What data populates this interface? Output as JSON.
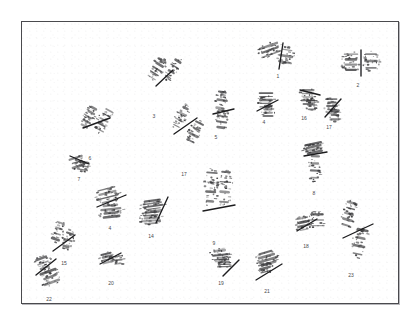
{
  "image": {
    "kind": "karyotype-chromosome-spread",
    "title": "",
    "background_color": "#ffffff",
    "frame_color": "#4a4a4e",
    "chromosome_ink_color": "#3a3a3c",
    "centromere_line_color": "#1c1c1e",
    "label_color": "#2e2e30",
    "width": 417,
    "height": 323
  },
  "plate": {
    "x": 21,
    "y": 21,
    "width": 378,
    "height": 283
  },
  "chart_data": {
    "type": "scatter",
    "title": "",
    "subtitle": "",
    "xlabel": "",
    "ylabel": "",
    "xlim": [
      0,
      417
    ],
    "ylim": [
      0,
      323
    ],
    "grid": false,
    "legend": "none",
    "annotations": [
      "Numbered human chromosome pairs arranged as a karyogram on a white plate with a thin dark frame"
    ],
    "categories": [
      "1",
      "2",
      "3",
      "4",
      "5",
      "6",
      "7",
      "8",
      "9",
      "11",
      "12",
      "14",
      "15",
      "16",
      "17",
      "18",
      "19",
      "20",
      "21",
      "22",
      "23"
    ],
    "values": [
      1,
      1,
      1,
      1,
      1,
      1,
      1,
      1,
      1,
      1,
      1,
      1,
      1,
      1,
      1,
      1,
      1,
      1,
      1,
      1,
      1
    ]
  },
  "chromosomes": [
    {
      "id": "chrom-1",
      "label": "1",
      "x": 253,
      "y": 35,
      "label_x": 277,
      "label_y": 73,
      "arms": [
        {
          "cx": 16,
          "cy": 14,
          "rx": 13,
          "ry": 7,
          "rot": -20,
          "blobs": 30
        },
        {
          "cx": 32,
          "cy": 20,
          "rx": 9,
          "ry": 10,
          "rot": 10,
          "blobs": 22
        }
      ],
      "bar": {
        "x1": 29,
        "y1": 7,
        "x2": 25,
        "y2": 33
      }
    },
    {
      "id": "chrom-2",
      "label": "2",
      "x": 338,
      "y": 46,
      "label_x": 357,
      "label_y": 82,
      "arms": [
        {
          "cx": 12,
          "cy": 15,
          "rx": 10,
          "ry": 11,
          "rot": 0,
          "blobs": 28
        },
        {
          "cx": 32,
          "cy": 14,
          "rx": 9,
          "ry": 11,
          "rot": 0,
          "blobs": 26
        }
      ],
      "bar": {
        "x1": 22,
        "y1": 3,
        "x2": 22,
        "y2": 29
      }
    },
    {
      "id": "chrom-3",
      "label": "3",
      "x": 142,
      "y": 52,
      "label_x": 153,
      "label_y": 113,
      "arms": [
        {
          "cx": 14,
          "cy": 16,
          "rx": 7,
          "ry": 13,
          "rot": 32,
          "blobs": 26
        },
        {
          "cx": 30,
          "cy": 16,
          "rx": 6,
          "ry": 13,
          "rot": 32,
          "blobs": 24
        }
      ],
      "bar": {
        "x1": 13,
        "y1": 33,
        "x2": 30,
        "y2": 17
      }
    },
    {
      "id": "chrom-6",
      "label": "6",
      "x": 75,
      "y": 100,
      "label_x": 89,
      "label_y": 155,
      "arms": [
        {
          "cx": 13,
          "cy": 16,
          "rx": 6,
          "ry": 13,
          "rot": 28,
          "blobs": 26
        },
        {
          "cx": 28,
          "cy": 19,
          "rx": 7,
          "ry": 14,
          "rot": 28,
          "blobs": 26
        }
      ],
      "bar": {
        "x1": 7,
        "y1": 27,
        "x2": 34,
        "y2": 17
      }
    },
    {
      "id": "chrom-17b",
      "label": "17",
      "x": 166,
      "y": 100,
      "label_x": 183,
      "label_y": 171,
      "arms": [
        {
          "cx": 14,
          "cy": 16,
          "rx": 6,
          "ry": 14,
          "rot": 27,
          "blobs": 26
        },
        {
          "cx": 28,
          "cy": 31,
          "rx": 7,
          "ry": 14,
          "rot": 27,
          "blobs": 26
        }
      ],
      "bar": {
        "x1": 7,
        "y1": 33,
        "x2": 30,
        "y2": 17
      }
    },
    {
      "id": "chrom-5",
      "label": "5",
      "x": 208,
      "y": 85,
      "label_x": 215,
      "label_y": 134,
      "arms": [
        {
          "cx": 12,
          "cy": 14,
          "rx": 6,
          "ry": 13,
          "rot": 8,
          "blobs": 24
        },
        {
          "cx": 13,
          "cy": 33,
          "rx": 7,
          "ry": 12,
          "rot": 8,
          "blobs": 24
        }
      ],
      "bar": {
        "x1": 4,
        "y1": 28,
        "x2": 25,
        "y2": 23
      }
    },
    {
      "id": "chrom-4",
      "label": "4",
      "x": 251,
      "y": 86,
      "label_x": 263,
      "label_y": 119,
      "arms": [
        {
          "cx": 14,
          "cy": 13,
          "rx": 9,
          "ry": 9,
          "rot": 0,
          "blobs": 22
        },
        {
          "cx": 16,
          "cy": 24,
          "rx": 7,
          "ry": 7,
          "rot": 0,
          "blobs": 16
        }
      ],
      "bar": {
        "x1": 5,
        "y1": 24,
        "x2": 26,
        "y2": 13
      }
    },
    {
      "id": "chrom-16",
      "label": "16",
      "x": 293,
      "y": 82,
      "label_x": 303,
      "label_y": 115,
      "arms": [
        {
          "cx": 14,
          "cy": 14,
          "rx": 9,
          "ry": 9,
          "rot": 0,
          "blobs": 24
        },
        {
          "cx": 18,
          "cy": 22,
          "rx": 7,
          "ry": 7,
          "rot": 0,
          "blobs": 16
        }
      ],
      "bar": {
        "x1": 6,
        "y1": 7,
        "x2": 26,
        "y2": 12
      }
    },
    {
      "id": "chrom-17a",
      "label": "17",
      "x": 318,
      "y": 92,
      "label_x": 328,
      "label_y": 124,
      "arms": [
        {
          "cx": 13,
          "cy": 13,
          "rx": 8,
          "ry": 9,
          "rot": 0,
          "blobs": 22
        },
        {
          "cx": 16,
          "cy": 22,
          "rx": 6,
          "ry": 7,
          "rot": 0,
          "blobs": 14
        }
      ],
      "bar": {
        "x1": 6,
        "y1": 24,
        "x2": 22,
        "y2": 6
      }
    },
    {
      "id": "chrom-8",
      "label": "8",
      "x": 296,
      "y": 133,
      "label_x": 313,
      "label_y": 190,
      "arms": [
        {
          "cx": 17,
          "cy": 14,
          "rx": 12,
          "ry": 6,
          "rot": -12,
          "blobs": 24
        },
        {
          "cx": 18,
          "cy": 33,
          "rx": 7,
          "ry": 15,
          "rot": 2,
          "blobs": 26
        }
      ],
      "bar": {
        "x1": 7,
        "y1": 22,
        "x2": 30,
        "y2": 18
      }
    },
    {
      "id": "chrom-7",
      "label": "7",
      "x": 63,
      "y": 148,
      "label_x": 78,
      "label_y": 176,
      "arms": [
        {
          "cx": 13,
          "cy": 13,
          "rx": 9,
          "ry": 7,
          "rot": -18,
          "blobs": 20
        },
        {
          "cx": 19,
          "cy": 17,
          "rx": 7,
          "ry": 6,
          "rot": 10,
          "blobs": 14
        }
      ],
      "bar": {
        "x1": 6,
        "y1": 7,
        "x2": 25,
        "y2": 15
      }
    },
    {
      "id": "chrom-4b",
      "label": "4",
      "x": 88,
      "y": 178,
      "label_x": 109,
      "label_y": 225,
      "arms": [
        {
          "cx": 19,
          "cy": 16,
          "rx": 14,
          "ry": 9,
          "rot": -14,
          "blobs": 32
        },
        {
          "cx": 22,
          "cy": 32,
          "rx": 13,
          "ry": 8,
          "rot": -6,
          "blobs": 30
        }
      ],
      "bar": {
        "x1": 8,
        "y1": 28,
        "x2": 37,
        "y2": 16
      }
    },
    {
      "id": "chrom-14",
      "label": "14",
      "x": 135,
      "y": 191,
      "label_x": 150,
      "label_y": 233,
      "arms": [
        {
          "cx": 17,
          "cy": 14,
          "rx": 13,
          "ry": 7,
          "rot": -8,
          "blobs": 26
        },
        {
          "cx": 15,
          "cy": 26,
          "rx": 12,
          "ry": 7,
          "rot": -4,
          "blobs": 26
        }
      ],
      "bar": {
        "x1": 32,
        "y1": 5,
        "x2": 20,
        "y2": 31
      }
    },
    {
      "id": "chrom-15",
      "label": "15",
      "x": 44,
      "y": 216,
      "label_x": 63,
      "label_y": 260,
      "arms": [
        {
          "cx": 13,
          "cy": 14,
          "rx": 6,
          "ry": 12,
          "rot": 18,
          "blobs": 22
        },
        {
          "cx": 23,
          "cy": 23,
          "rx": 6,
          "ry": 11,
          "rot": 18,
          "blobs": 22
        }
      ],
      "bar": {
        "x1": 8,
        "y1": 34,
        "x2": 30,
        "y2": 18
      }
    },
    {
      "id": "chrom-22",
      "label": "22",
      "x": 27,
      "y": 248,
      "label_x": 48,
      "label_y": 296,
      "arms": [
        {
          "cx": 15,
          "cy": 14,
          "rx": 9,
          "ry": 8,
          "rot": -20,
          "blobs": 24
        },
        {
          "cx": 22,
          "cy": 28,
          "rx": 11,
          "ry": 9,
          "rot": -20,
          "blobs": 28
        }
      ],
      "bar": {
        "x1": 8,
        "y1": 26,
        "x2": 28,
        "y2": 10
      }
    },
    {
      "id": "chrom-20",
      "label": "20",
      "x": 94,
      "y": 245,
      "label_x": 110,
      "label_y": 280,
      "arms": [
        {
          "cx": 12,
          "cy": 12,
          "rx": 8,
          "ry": 6,
          "rot": -14,
          "blobs": 18
        },
        {
          "cx": 23,
          "cy": 14,
          "rx": 7,
          "ry": 6,
          "rot": -6,
          "blobs": 16
        }
      ],
      "bar": {
        "x1": 5,
        "y1": 18,
        "x2": 26,
        "y2": 7
      }
    },
    {
      "id": "chrom-9",
      "label": "9",
      "x": 197,
      "y": 164,
      "label_x": 213,
      "label_y": 240,
      "arms": [
        {
          "cx": 13,
          "cy": 22,
          "rx": 7,
          "ry": 20,
          "rot": 4,
          "blobs": 32
        },
        {
          "cx": 27,
          "cy": 22,
          "rx": 8,
          "ry": 21,
          "rot": 4,
          "blobs": 34
        }
      ],
      "bar": {
        "x1": 5,
        "y1": 46,
        "x2": 37,
        "y2": 40
      }
    },
    {
      "id": "chrom-19",
      "label": "19",
      "x": 204,
      "y": 241,
      "label_x": 220,
      "label_y": 280,
      "arms": [
        {
          "cx": 15,
          "cy": 13,
          "rx": 11,
          "ry": 7,
          "rot": -6,
          "blobs": 24
        },
        {
          "cx": 19,
          "cy": 20,
          "rx": 9,
          "ry": 6,
          "rot": -2,
          "blobs": 18
        }
      ],
      "bar": {
        "x1": 18,
        "y1": 34,
        "x2": 34,
        "y2": 18
      }
    },
    {
      "id": "chrom-21",
      "label": "21",
      "x": 249,
      "y": 243,
      "label_x": 266,
      "label_y": 288,
      "arms": [
        {
          "cx": 17,
          "cy": 14,
          "rx": 12,
          "ry": 8,
          "rot": -16,
          "blobs": 26
        },
        {
          "cx": 15,
          "cy": 24,
          "rx": 9,
          "ry": 6,
          "rot": -14,
          "blobs": 18
        }
      ],
      "bar": {
        "x1": 6,
        "y1": 36,
        "x2": 32,
        "y2": 20
      }
    },
    {
      "id": "chrom-18",
      "label": "18",
      "x": 290,
      "y": 206,
      "label_x": 305,
      "label_y": 243,
      "arms": [
        {
          "cx": 12,
          "cy": 17,
          "rx": 8,
          "ry": 8,
          "rot": -12,
          "blobs": 22
        },
        {
          "cx": 26,
          "cy": 13,
          "rx": 9,
          "ry": 9,
          "rot": 0,
          "blobs": 24
        }
      ],
      "bar": {
        "x1": 6,
        "y1": 24,
        "x2": 26,
        "y2": 12
      }
    },
    {
      "id": "chrom-23",
      "label": "23",
      "x": 332,
      "y": 197,
      "label_x": 350,
      "label_y": 272,
      "arms": [
        {
          "cx": 16,
          "cy": 16,
          "rx": 7,
          "ry": 15,
          "rot": 16,
          "blobs": 28
        },
        {
          "cx": 27,
          "cy": 44,
          "rx": 8,
          "ry": 17,
          "rot": 12,
          "blobs": 30
        }
      ],
      "bar": {
        "x1": 10,
        "y1": 40,
        "x2": 40,
        "y2": 26
      }
    }
  ]
}
